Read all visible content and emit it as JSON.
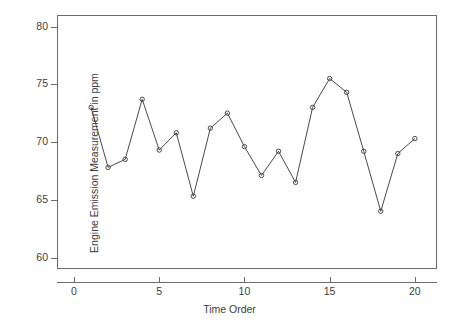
{
  "chart_data": {
    "type": "line",
    "title": "",
    "xlabel": "Time Order",
    "ylabel": "Engine Emission Measurement in ppm",
    "xlim": [
      -1,
      21.3
    ],
    "ylim": [
      59.0,
      81.0
    ],
    "xticks": [
      0,
      5,
      10,
      15,
      20
    ],
    "xtick_labels": [
      "0",
      "5",
      "10",
      "15",
      "20"
    ],
    "yticks": [
      60,
      65,
      70,
      75,
      80
    ],
    "ytick_labels": [
      "60",
      "65",
      "70",
      "75",
      "80"
    ],
    "grid": false,
    "legend": false,
    "marker": "open-circle",
    "line_color": "#4a4a4a",
    "x": [
      1,
      2,
      3,
      4,
      5,
      6,
      7,
      8,
      9,
      10,
      11,
      12,
      13,
      14,
      15,
      16,
      17,
      18,
      19,
      20
    ],
    "values": [
      73.0,
      67.8,
      68.5,
      73.7,
      69.3,
      70.8,
      65.3,
      71.2,
      72.5,
      69.6,
      67.1,
      69.2,
      66.5,
      73.0,
      75.5,
      74.3,
      69.2,
      64.0,
      69.0,
      70.3
    ],
    "series": [
      {
        "name": "Engine Emission Measurement in ppm",
        "values": [
          73.0,
          67.8,
          68.5,
          73.7,
          69.3,
          70.8,
          65.3,
          71.2,
          72.5,
          69.6,
          67.1,
          69.2,
          66.5,
          73.0,
          75.5,
          74.3,
          69.2,
          64.0,
          69.0,
          70.3
        ]
      }
    ]
  }
}
